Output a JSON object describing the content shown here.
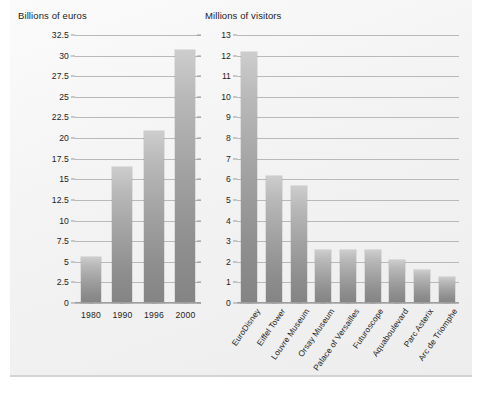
{
  "chart_data": [
    {
      "type": "bar",
      "title": "Billions of euros",
      "xlabel": "",
      "ylabel": "Billions of euros",
      "categories": [
        "1980",
        "1990",
        "1996",
        "2000"
      ],
      "values": [
        5.6,
        16.5,
        20.8,
        30.7
      ],
      "ylim": [
        0,
        32.5
      ],
      "ytick_step": 2.5,
      "yticks": [
        "0",
        "2.5",
        "5",
        "7.5",
        "10",
        "12.5",
        "15",
        "17.5",
        "20",
        "22.5",
        "25",
        "27.5",
        "30",
        "32.5"
      ],
      "grid": true,
      "legend": "none",
      "bar_color": "#a2a2a2"
    },
    {
      "type": "bar",
      "title": "Millions of visitors",
      "xlabel": "",
      "ylabel": "Millions of visitors",
      "categories": [
        "EuroDisney",
        "Eiffel Tower",
        "Louvre Museum",
        "Orsay Museum",
        "Palace of Versailles",
        "Futuroscope",
        "Aquaboulevard",
        "Parc Asterix",
        "Arc de Triomphe"
      ],
      "values": [
        12.2,
        6.15,
        5.7,
        2.55,
        2.55,
        2.55,
        2.1,
        1.6,
        1.25
      ],
      "ylim": [
        0,
        13
      ],
      "ytick_step": 1,
      "yticks": [
        "0",
        "1",
        "2",
        "3",
        "4",
        "5",
        "6",
        "7",
        "8",
        "9",
        "10",
        "11",
        "12",
        "13"
      ],
      "grid": true,
      "legend": "none",
      "bar_color": "#a2a2a2"
    }
  ]
}
